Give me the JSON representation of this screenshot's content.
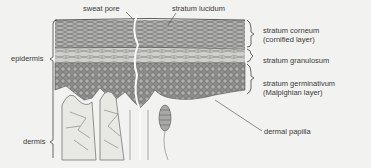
{
  "diagram": {
    "labels": {
      "sweat_pore": "sweat pore",
      "stratum_lucidum": "stratum lucidum",
      "stratum_corneum": "stratum corneum",
      "stratum_corneum_sub": "(cornified layer)",
      "stratum_granulosum": "stratum granulosum",
      "stratum_germinativum": "stratum germinativum",
      "stratum_germinativum_sub": "(Malpighian layer)",
      "epidermis": "epidermis",
      "dermis": "dermis",
      "dermal_papilla": "dermal papilla"
    },
    "colors": {
      "background": "#f2f2f0",
      "ink": "#3a3a3a",
      "corneum": "#9a9a98",
      "granulosum": "#c4c4c0",
      "germinativum": "#8a8a88",
      "dermis": "#e6e6e4"
    }
  }
}
